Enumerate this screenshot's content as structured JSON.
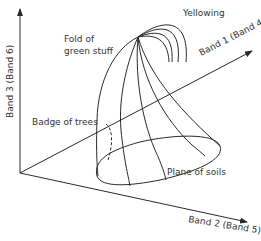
{
  "axes": {
    "y_axis": {
      "label": "Band 3 (Band 6)"
    },
    "x_axis_diag": {
      "label": "Band 1 (Band 4)"
    },
    "x_axis": {
      "label": "Band 2 (Band 5)"
    }
  },
  "annotations": {
    "yellowing": "Yellowing",
    "fold_line1": "Fold of",
    "fold_line2": "green stuff",
    "badge": "Badge of trees",
    "plane": "Plane of soils"
  },
  "colors": {
    "line": "#2a2a2a",
    "text": "#333333",
    "background": "#ffffff"
  }
}
